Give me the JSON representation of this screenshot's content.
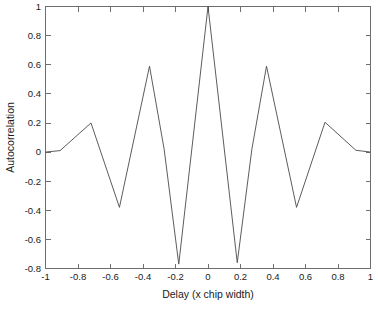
{
  "chart_data": {
    "type": "line",
    "title": "",
    "subtitle": "",
    "xlabel": "Delay (x chip width)",
    "ylabel": "Autocorrelation",
    "xlim": [
      -1,
      1
    ],
    "ylim": [
      -0.8,
      1
    ],
    "grid": false,
    "legend": null,
    "xticks": [
      -1,
      -0.8,
      -0.6,
      -0.4,
      -0.2,
      0,
      0.2,
      0.4,
      0.6,
      0.8,
      1
    ],
    "xtick_labels": [
      "-1",
      "-0.8",
      "-0.6",
      "-0.4",
      "-0.2",
      "0",
      "0.2",
      "0.4",
      "0.6",
      "0.8",
      "1"
    ],
    "yticks": [
      -0.8,
      -0.6,
      -0.4,
      -0.2,
      0,
      0.2,
      0.4,
      0.6,
      0.8,
      1
    ],
    "ytick_labels": [
      "-0.8",
      "-0.6",
      "-0.4",
      "-0.2",
      "0",
      "0.2",
      "0.4",
      "0.6",
      "0.8",
      "1"
    ],
    "line_color": "#4a4a4a",
    "series": [
      {
        "name": "autocorrelation",
        "x": [
          -1.0,
          -0.91,
          -0.72,
          -0.545,
          -0.36,
          -0.27,
          -0.18,
          0.0,
          0.18,
          0.27,
          0.36,
          0.545,
          0.72,
          0.91,
          1.0
        ],
        "y": [
          0.0,
          0.01,
          0.2,
          -0.38,
          0.59,
          0.02,
          -0.77,
          1.0,
          -0.76,
          0.02,
          0.59,
          -0.38,
          0.205,
          0.012,
          0.0
        ]
      }
    ],
    "annotations": []
  },
  "figure": {
    "background_color": "#ffffff",
    "axes_color": "#6e6e6e",
    "text_color": "#1a1a1a"
  }
}
